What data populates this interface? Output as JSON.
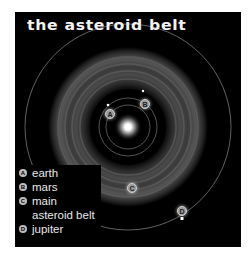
{
  "title": "the asteroid belt",
  "colors": {
    "background": "#000000",
    "text": "#f2f2f2",
    "orbit": "#9a9a9a",
    "badge": "#bdbdbd"
  },
  "markers": [
    {
      "letter": "A",
      "object": "earth"
    },
    {
      "letter": "B",
      "object": "mars"
    },
    {
      "letter": "C",
      "object": "main asteroid belt"
    },
    {
      "letter": "D",
      "object": "jupiter"
    }
  ],
  "legend": [
    {
      "badge": "A",
      "label": "earth"
    },
    {
      "badge": "B",
      "label": "mars"
    },
    {
      "badge": "C",
      "label": "main"
    },
    {
      "badge": "",
      "label": "asteroid belt"
    },
    {
      "badge": "D",
      "label": "jupiter"
    }
  ]
}
